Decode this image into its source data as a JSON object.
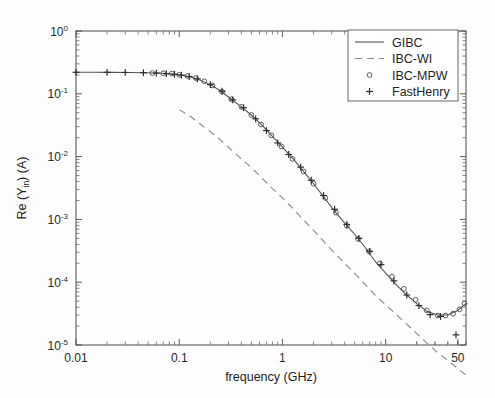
{
  "chart_data": {
    "type": "line",
    "title": "",
    "xlabel": "frequency (GHz)",
    "ylabel": "Re (Y_in) (A)",
    "ylabel_parts": {
      "pre": "Re (Y",
      "sub": "in",
      "post": ") (A)"
    },
    "xscale": "log",
    "yscale": "log",
    "xlim": [
      0.01,
      60
    ],
    "ylim": [
      1e-05,
      1
    ],
    "grid": false,
    "legend_position": "top-right",
    "x_tick_labels": [
      "0.01",
      "0.1",
      "1",
      "10",
      "50"
    ],
    "x_tick_values": [
      0.01,
      0.1,
      1,
      10,
      50
    ],
    "y_tick_labels": [
      "10^0",
      "10^-1",
      "10^-2",
      "10^-3",
      "10^-4",
      "10^-5"
    ],
    "y_tick_exponents": [
      "0",
      "-1",
      "-2",
      "-3",
      "-4",
      "-5"
    ],
    "y_tick_values": [
      1,
      0.1,
      0.01,
      0.001,
      0.0001,
      1e-05
    ],
    "series": [
      {
        "name": "GIBC",
        "style": "solid",
        "marker": "none",
        "x": [
          0.01,
          0.015,
          0.022,
          0.032,
          0.047,
          0.068,
          0.1,
          0.13,
          0.16,
          0.2,
          0.25,
          0.32,
          0.4,
          0.5,
          0.63,
          0.8,
          1.0,
          1.3,
          1.6,
          2.0,
          2.5,
          3.2,
          4.0,
          5.0,
          6.3,
          8.0,
          10.0,
          13.0,
          16.0,
          20.0,
          25.0,
          32.0,
          40.0,
          50.0,
          60.0
        ],
        "y": [
          0.22,
          0.22,
          0.219,
          0.218,
          0.216,
          0.212,
          0.2,
          0.185,
          0.165,
          0.14,
          0.112,
          0.082,
          0.062,
          0.046,
          0.032,
          0.021,
          0.0142,
          0.0088,
          0.0058,
          0.0037,
          0.0023,
          0.00135,
          0.00088,
          0.00058,
          0.00036,
          0.00021,
          0.00014,
          8.75e-05,
          6.25e-05,
          4.55e-05,
          3.45e-05,
          3e-05,
          3e-05,
          3.55e-05,
          4.6e-05
        ]
      },
      {
        "name": "IBC-WI",
        "style": "dashed",
        "marker": "none",
        "x": [
          0.1,
          0.13,
          0.16,
          0.2,
          0.25,
          0.32,
          0.4,
          0.5,
          0.63,
          0.8,
          1.0,
          1.3,
          1.6,
          2.0,
          2.5,
          3.2,
          4.0,
          5.0,
          6.3,
          8.0,
          10.0,
          13.0,
          16.0,
          20.0,
          25.0,
          32.0,
          40.0,
          50.0,
          60.0
        ],
        "y": [
          0.056,
          0.043,
          0.033,
          0.025,
          0.0185,
          0.0128,
          0.0092,
          0.0067,
          0.0046,
          0.0031,
          0.0022,
          0.00142,
          0.00098,
          0.00067,
          0.00045,
          0.00029,
          0.0002,
          0.000138,
          9.25e-05,
          6.1e-05,
          4.35e-05,
          2.95e-05,
          2.15e-05,
          1.52e-05,
          1.08e-05,
          7.5e-06,
          5.7e-06,
          4.2e-06,
          3.3e-06
        ]
      },
      {
        "name": "IBC-MPW",
        "style": "none",
        "marker": "circle",
        "x": [
          0.055,
          0.07,
          0.085,
          0.1,
          0.12,
          0.145,
          0.175,
          0.21,
          0.26,
          0.32,
          0.4,
          0.5,
          0.62,
          0.78,
          0.98,
          1.25,
          1.6,
          2.0,
          2.6,
          3.3,
          4.2,
          5.4,
          6.9,
          8.8,
          11.5,
          15.0,
          19.5,
          25.0,
          32.0,
          38.0,
          45.0,
          52.0,
          58.0
        ],
        "y": [
          0.214,
          0.212,
          0.21,
          0.2,
          0.192,
          0.178,
          0.158,
          0.136,
          0.108,
          0.082,
          0.062,
          0.046,
          0.0325,
          0.0218,
          0.0145,
          0.0092,
          0.0058,
          0.0037,
          0.0022,
          0.00128,
          0.00079,
          0.00049,
          0.00031,
          0.0002,
          0.000122,
          7.85e-05,
          5.25e-05,
          3.55e-05,
          2.95e-05,
          2.95e-05,
          3.15e-05,
          3.7e-05,
          4.6e-05
        ]
      },
      {
        "name": "FastHenry",
        "style": "none",
        "marker": "plus",
        "x": [
          0.01,
          0.02,
          0.03,
          0.045,
          0.06,
          0.075,
          0.09,
          0.105,
          0.125,
          0.15,
          0.2,
          0.26,
          0.33,
          0.42,
          0.55,
          0.7,
          0.9,
          1.15,
          1.5,
          1.9,
          2.5,
          3.2,
          4.2,
          5.5,
          7.0,
          9.0,
          12.0,
          16.0,
          21.0,
          27.0,
          34.0,
          48.0
        ],
        "y": [
          0.22,
          0.22,
          0.219,
          0.217,
          0.214,
          0.21,
          0.205,
          0.198,
          0.188,
          0.173,
          0.14,
          0.11,
          0.08,
          0.06,
          0.04,
          0.026,
          0.0165,
          0.0108,
          0.0068,
          0.0042,
          0.0024,
          0.00145,
          0.00083,
          0.0005,
          0.00031,
          0.00019,
          0.000105,
          6.25e-05,
          4.25e-05,
          3.05e-05,
          2.85e-05,
          1.45e-05
        ]
      }
    ]
  },
  "legend": {
    "entries": [
      {
        "label": "GIBC",
        "sample": "solid-line"
      },
      {
        "label": "IBC-WI",
        "sample": "dashed-line"
      },
      {
        "label": "IBC-MPW",
        "sample": "circle-marker"
      },
      {
        "label": "FastHenry",
        "sample": "plus-marker"
      }
    ]
  },
  "colors": {
    "solid_curve": "#555555",
    "dashed_curve": "#8a8a8a",
    "circle_marker": "#4d4d4d",
    "plus_marker": "#2e2e2e",
    "axis": "#4a4a4a",
    "background": "#fdfdfd"
  }
}
